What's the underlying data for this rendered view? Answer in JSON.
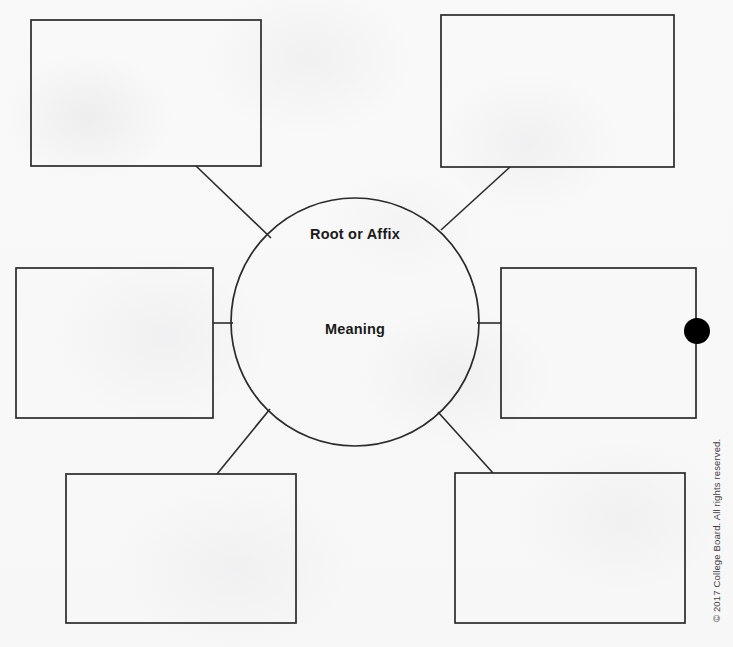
{
  "page": {
    "background_color": "#f8f8f8",
    "stroke_color": "#2b2b2b",
    "text_color": "#1a1a1a",
    "marker_color": "#000000"
  },
  "center": {
    "shape": "circle",
    "cx": 355,
    "cy": 322,
    "r": 124,
    "labels": {
      "top": "Root or Affix",
      "middle": "Meaning"
    }
  },
  "boxes": [
    {
      "id": "box-top-left",
      "label": "",
      "x": 31,
      "y": 20,
      "width": 230,
      "height": 146
    },
    {
      "id": "box-top-right",
      "label": "",
      "x": 441,
      "y": 15,
      "width": 233,
      "height": 152
    },
    {
      "id": "box-middle-left",
      "label": "",
      "x": 16,
      "y": 268,
      "width": 197,
      "height": 150
    },
    {
      "id": "box-middle-right",
      "label": "",
      "x": 501,
      "y": 268,
      "width": 195,
      "height": 150
    },
    {
      "id": "box-bottom-left",
      "label": "",
      "x": 66,
      "y": 474,
      "width": 230,
      "height": 149
    },
    {
      "id": "box-bottom-right",
      "label": "",
      "x": 455,
      "y": 473,
      "width": 230,
      "height": 150
    }
  ],
  "connectors": [
    {
      "id": "connector-top-left",
      "from": "box-top-left",
      "to": "center",
      "x1": 196,
      "y1": 166,
      "x2": 271,
      "y2": 238
    },
    {
      "id": "connector-top-right",
      "from": "box-top-right",
      "to": "center",
      "x1": 510,
      "y1": 167,
      "x2": 441,
      "y2": 230
    },
    {
      "id": "connector-middle-left",
      "from": "box-middle-left",
      "to": "center",
      "x1": 213,
      "y1": 323,
      "x2": 232,
      "y2": 323
    },
    {
      "id": "connector-middle-right",
      "from": "box-middle-right",
      "to": "center",
      "x1": 478,
      "y1": 323,
      "x2": 501,
      "y2": 323
    },
    {
      "id": "connector-bottom-left",
      "from": "center",
      "to": "box-bottom-left",
      "x1": 270,
      "y1": 409,
      "x2": 217,
      "y2": 474
    },
    {
      "id": "connector-bottom-right",
      "from": "center",
      "to": "box-bottom-right",
      "x1": 438,
      "y1": 412,
      "x2": 493,
      "y2": 473
    }
  ],
  "marker": {
    "id": "selection-dot",
    "shape": "filled-circle",
    "cx": 697,
    "cy": 331,
    "r": 13
  },
  "footer": {
    "copyright": "© 2017 College Board. All rights reserved."
  }
}
